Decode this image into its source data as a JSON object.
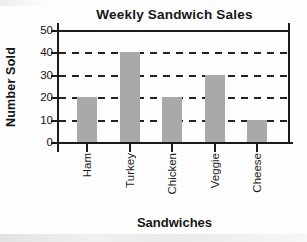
{
  "chart_data": {
    "type": "bar",
    "title": "Weekly Sandwich Sales",
    "xlabel": "Sandwiches",
    "ylabel": "Number Sold",
    "categories": [
      "Ham",
      "Turkey",
      "Chicken",
      "Veggie",
      "Cheese"
    ],
    "values": [
      20,
      40,
      20,
      30,
      10
    ],
    "yticks": [
      0,
      10,
      20,
      30,
      40,
      50
    ],
    "ylim": [
      0,
      50
    ],
    "gridline_levels": [
      10,
      20,
      30,
      40
    ],
    "gridline_style": "dashed",
    "legend": "none",
    "bar_color": "#a9a9a9",
    "axis_color": "#1b1b1b",
    "text_color": "#161616",
    "background_color": "#fdfdfd"
  }
}
